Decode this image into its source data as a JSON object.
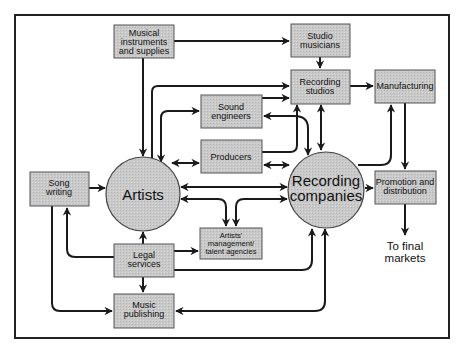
{
  "diagram": {
    "type": "flow",
    "nodes": {
      "musical_instruments": {
        "lines": [
          "Musical",
          "instruments",
          "and supplies"
        ],
        "shape": "box"
      },
      "studio_musicians": {
        "lines": [
          "Studio",
          "musicians"
        ],
        "shape": "box"
      },
      "recording_studios": {
        "lines": [
          "Recording",
          "studios"
        ],
        "shape": "box"
      },
      "manufacturing": {
        "lines": [
          "Manufacturing"
        ],
        "shape": "box"
      },
      "sound_engineers": {
        "lines": [
          "Sound",
          "engineers"
        ],
        "shape": "box"
      },
      "producers": {
        "lines": [
          "Producers"
        ],
        "shape": "box"
      },
      "artists": {
        "lines": [
          "Artists"
        ],
        "shape": "circle"
      },
      "recording_companies": {
        "lines": [
          "Recording",
          "companies"
        ],
        "shape": "circle"
      },
      "promotion_distribution": {
        "lines": [
          "Promotion and",
          "distribution"
        ],
        "shape": "box"
      },
      "song_writing": {
        "lines": [
          "Song",
          "writing"
        ],
        "shape": "box"
      },
      "artists_management": {
        "lines": [
          "Artists'",
          "management/",
          "talent agencies"
        ],
        "shape": "box"
      },
      "legal_services": {
        "lines": [
          "Legal",
          "services"
        ],
        "shape": "box"
      },
      "music_publishing": {
        "lines": [
          "Music",
          "publishing"
        ],
        "shape": "box"
      },
      "final_markets": {
        "lines": [
          "To final",
          "markets"
        ],
        "shape": "text"
      }
    },
    "edges": [
      {
        "from": "musical_instruments",
        "to": "studio_musicians",
        "direction": "forward"
      },
      {
        "from": "musical_instruments",
        "to": "artists",
        "direction": "forward"
      },
      {
        "from": "studio_musicians",
        "to": "recording_studios",
        "direction": "forward"
      },
      {
        "from": "artists",
        "to": "recording_studios",
        "direction": "forward"
      },
      {
        "from": "artists",
        "to": "sound_engineers",
        "direction": "both"
      },
      {
        "from": "artists",
        "to": "producers",
        "direction": "both"
      },
      {
        "from": "sound_engineers",
        "to": "recording_studios",
        "direction": "forward"
      },
      {
        "from": "recording_studios",
        "to": "sound_engineers",
        "direction": "forward"
      },
      {
        "from": "producers",
        "to": "recording_studios",
        "direction": "forward"
      },
      {
        "from": "producers",
        "to": "recording_companies",
        "direction": "both"
      },
      {
        "from": "recording_studios",
        "to": "recording_companies",
        "direction": "both"
      },
      {
        "from": "recording_studios",
        "to": "manufacturing",
        "direction": "forward"
      },
      {
        "from": "recording_companies",
        "to": "manufacturing",
        "direction": "forward"
      },
      {
        "from": "manufacturing",
        "to": "promotion_distribution",
        "direction": "forward"
      },
      {
        "from": "recording_companies",
        "to": "promotion_distribution",
        "direction": "forward"
      },
      {
        "from": "promotion_distribution",
        "to": "final_markets",
        "direction": "forward"
      },
      {
        "from": "song_writing",
        "to": "artists",
        "direction": "forward"
      },
      {
        "from": "artists",
        "to": "recording_companies",
        "direction": "both"
      },
      {
        "from": "artists",
        "to": "artists_management",
        "direction": "both"
      },
      {
        "from": "recording_companies",
        "to": "artists_management",
        "direction": "both"
      },
      {
        "from": "legal_services",
        "to": "artists",
        "direction": "forward"
      },
      {
        "from": "legal_services",
        "to": "song_writing",
        "direction": "forward"
      },
      {
        "from": "legal_services",
        "to": "artists_management",
        "direction": "forward"
      },
      {
        "from": "legal_services",
        "to": "recording_companies",
        "direction": "forward"
      },
      {
        "from": "legal_services",
        "to": "music_publishing",
        "direction": "forward"
      },
      {
        "from": "song_writing",
        "to": "music_publishing",
        "direction": "forward"
      },
      {
        "from": "recording_companies",
        "to": "music_publishing",
        "direction": "both"
      }
    ]
  }
}
